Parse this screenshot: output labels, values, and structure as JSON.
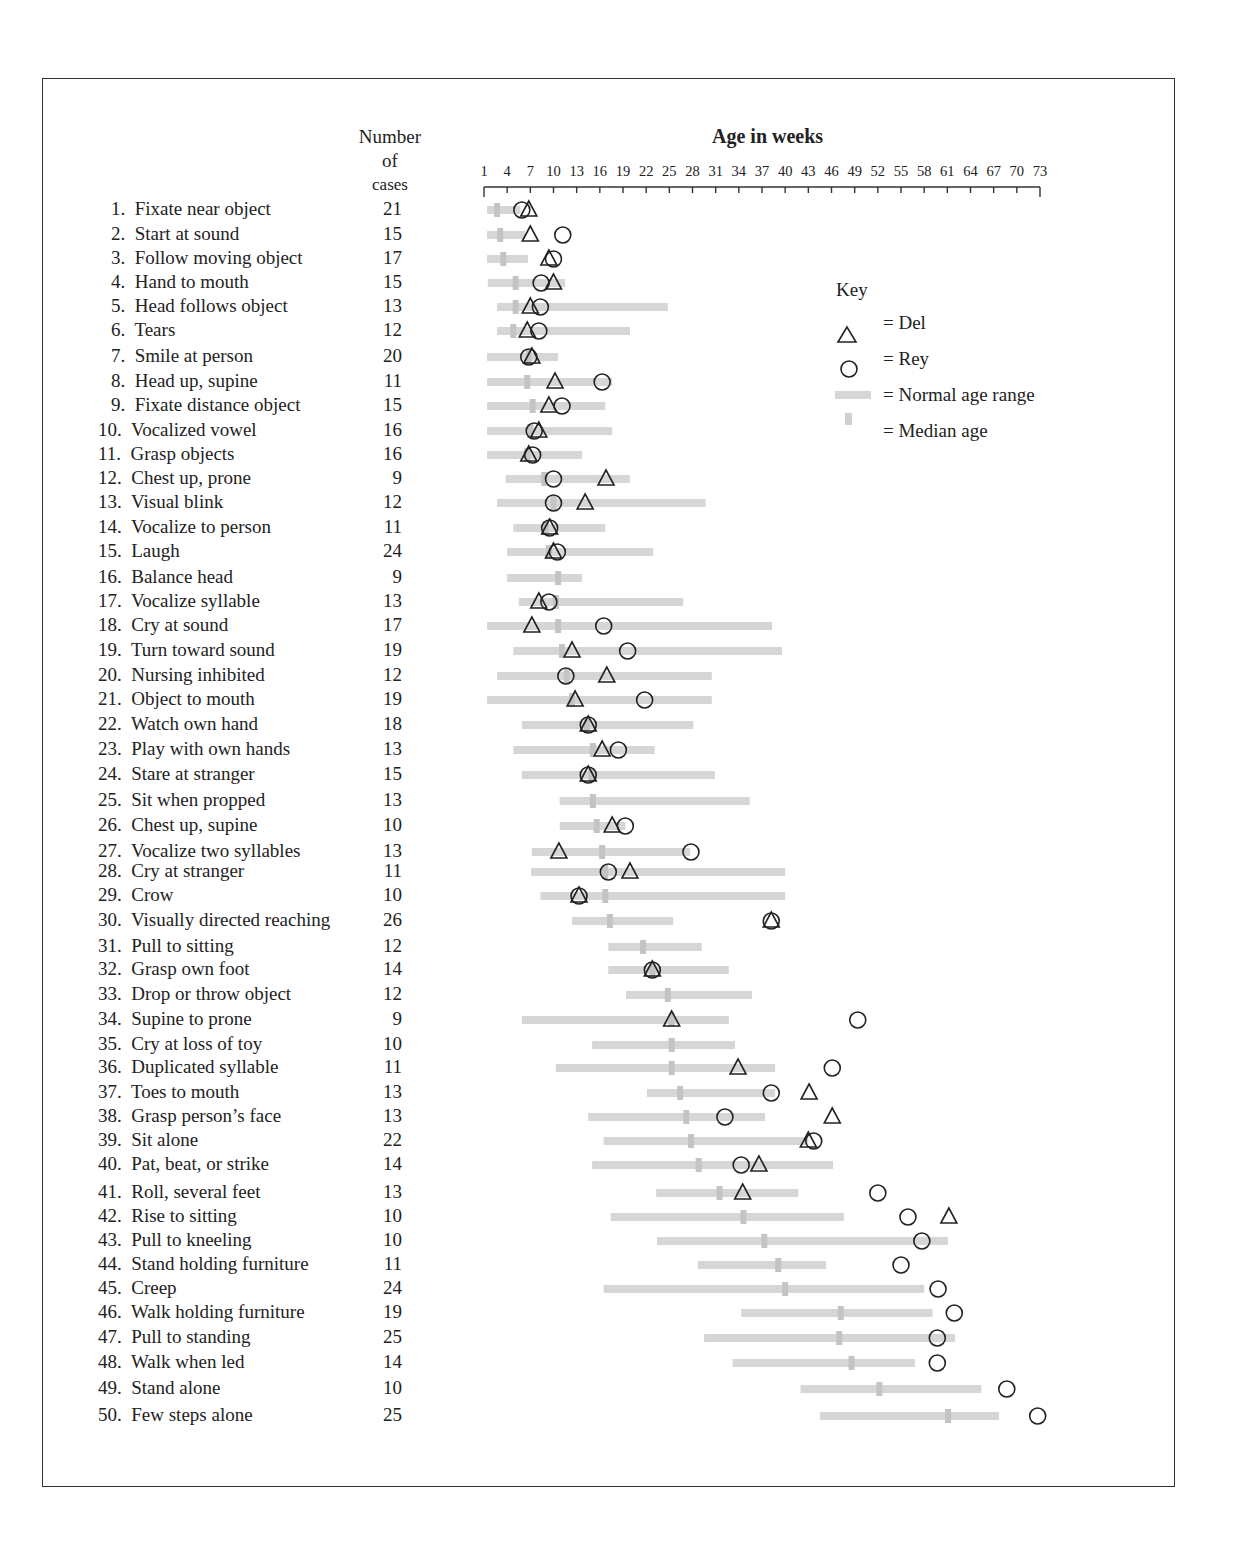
{
  "header": {
    "cases_line1": "Number",
    "cases_line2": "of",
    "cases_line3": "cases",
    "axis_title": "Age in weeks"
  },
  "key": {
    "title": "Key",
    "del": "= Del",
    "rey": "= Rey",
    "range": "= Normal age range",
    "median": "= Median age"
  },
  "colors": {
    "range_bar": "#d6d6d6",
    "median": "#c4c4c4",
    "marker": "#222222"
  },
  "chart_data": {
    "type": "range-dot",
    "title": "Age in weeks",
    "xlabel": "Age in weeks",
    "xlim": [
      1,
      73
    ],
    "xticks": [
      1,
      4,
      7,
      10,
      13,
      16,
      19,
      22,
      25,
      28,
      31,
      34,
      37,
      40,
      43,
      46,
      49,
      52,
      55,
      58,
      61,
      64,
      67,
      70,
      73
    ],
    "legend": [
      "Del (triangle)",
      "Rey (circle)",
      "Normal age range (gray bar)",
      "Median age (gray tick)"
    ],
    "items": [
      {
        "n": 1,
        "label": "Fixate near object",
        "cases": 21,
        "range": [
          1.4,
          5.7
        ],
        "median": 2.7,
        "del": 6.8,
        "rey": 5.9
      },
      {
        "n": 2,
        "label": "Start at sound",
        "cases": 15,
        "range": [
          1.4,
          6.3
        ],
        "median": 3.1,
        "del": 7.0,
        "rey": 11.2
      },
      {
        "n": 3,
        "label": "Follow moving object",
        "cases": 17,
        "range": [
          1.4,
          6.7
        ],
        "median": 3.5,
        "del": 9.4,
        "rey": 10.0
      },
      {
        "n": 4,
        "label": "Hand to mouth",
        "cases": 15,
        "range": [
          1.5,
          11.5
        ],
        "median": 5.1,
        "del": 10.0,
        "rey": 8.4
      },
      {
        "n": 5,
        "label": "Head follows object",
        "cases": 13,
        "range": [
          2.7,
          24.8
        ],
        "median": 5.1,
        "del": 7.0,
        "rey": 8.3
      },
      {
        "n": 6,
        "label": "Tears",
        "cases": 12,
        "range": [
          2.7,
          19.9
        ],
        "median": 4.8,
        "del": 6.6,
        "rey": 8.1
      },
      {
        "n": 7,
        "label": "Smile at person",
        "cases": 20,
        "range": [
          1.4,
          10.6
        ],
        "median": 6.8,
        "del": 7.2,
        "rey": 6.8
      },
      {
        "n": 8,
        "label": "Head up, supine",
        "cases": 11,
        "range": [
          1.4,
          17.6
        ],
        "median": 6.6,
        "del": 10.2,
        "rey": 16.3
      },
      {
        "n": 9,
        "label": "Fixate distance object",
        "cases": 15,
        "range": [
          1.4,
          16.7
        ],
        "median": 7.3,
        "del": 9.4,
        "rey": 11.1
      },
      {
        "n": 10,
        "label": "Vocalized vowel",
        "cases": 16,
        "range": [
          1.4,
          17.6
        ],
        "median": 7.0,
        "del": 8.1,
        "rey": 7.5
      },
      {
        "n": 11,
        "label": "Grasp objects",
        "cases": 16,
        "range": [
          1.4,
          13.7
        ],
        "median": 6.6,
        "del": 6.8,
        "rey": 7.3
      },
      {
        "n": 12,
        "label": "Chest up, prone",
        "cases": 9,
        "range": [
          3.8,
          19.9
        ],
        "median": 8.8,
        "del": 16.8,
        "rey": 10.0
      },
      {
        "n": 13,
        "label": "Visual blink",
        "cases": 12,
        "range": [
          2.7,
          29.7
        ],
        "median": 10.0,
        "del": 14.1,
        "rey": 10.0
      },
      {
        "n": 14,
        "label": "Vocalize to person",
        "cases": 11,
        "range": [
          4.8,
          16.7
        ],
        "median": 9.0,
        "del": 9.5,
        "rey": 9.5
      },
      {
        "n": 15,
        "label": "Laugh",
        "cases": 24,
        "range": [
          4.0,
          22.9
        ],
        "median": 9.4,
        "del": 10.0,
        "rey": 10.5
      },
      {
        "n": 16,
        "label": "Balance head",
        "cases": 9,
        "range": [
          4.0,
          13.7
        ],
        "median": 10.6,
        "del": null,
        "rey": null
      },
      {
        "n": 17,
        "label": "Vocalize syllable",
        "cases": 13,
        "range": [
          5.5,
          26.8
        ],
        "median": 10.3,
        "del": 8.1,
        "rey": 9.4
      },
      {
        "n": 18,
        "label": "Cry at sound",
        "cases": 17,
        "range": [
          1.4,
          38.3
        ],
        "median": 10.6,
        "del": 7.2,
        "rey": 16.5
      },
      {
        "n": 19,
        "label": "Turn toward sound",
        "cases": 19,
        "range": [
          4.8,
          39.6
        ],
        "median": 11.1,
        "del": 12.4,
        "rey": 19.6
      },
      {
        "n": 20,
        "label": "Nursing inhibited",
        "cases": 12,
        "range": [
          2.7,
          30.5
        ],
        "median": 11.7,
        "del": 16.9,
        "rey": 11.6
      },
      {
        "n": 21,
        "label": "Object to mouth",
        "cases": 19,
        "range": [
          1.4,
          30.5
        ],
        "median": 12.4,
        "del": 12.8,
        "rey": 21.8
      },
      {
        "n": 22,
        "label": "Watch own hand",
        "cases": 18,
        "range": [
          5.9,
          28.1
        ],
        "median": 14.3,
        "del": 14.5,
        "rey": 14.5
      },
      {
        "n": 23,
        "label": "Play with own hands",
        "cases": 13,
        "range": [
          4.8,
          23.1
        ],
        "median": 15.1,
        "del": 16.3,
        "rey": 18.4
      },
      {
        "n": 24,
        "label": "Stare at stranger",
        "cases": 15,
        "range": [
          5.9,
          30.9
        ],
        "median": 14.9,
        "del": 14.5,
        "rey": 14.5
      },
      {
        "n": 25,
        "label": "Sit when propped",
        "cases": 13,
        "range": [
          10.8,
          35.4
        ],
        "median": 15.1,
        "del": null,
        "rey": null
      },
      {
        "n": 26,
        "label": "Chest up, supine",
        "cases": 10,
        "range": [
          10.8,
          19.3
        ],
        "median": 15.6,
        "del": 17.6,
        "rey": 19.3
      },
      {
        "n": 27,
        "label": "Vocalize two syllables",
        "cases": 13,
        "range": [
          7.2,
          27.7
        ],
        "median": 16.3,
        "del": 10.7,
        "rey": 27.8
      },
      {
        "n": 28,
        "label": "Cry at stranger",
        "cases": 11,
        "range": [
          7.1,
          40.0
        ],
        "median": 16.7,
        "del": 19.9,
        "rey": 17.1
      },
      {
        "n": 29,
        "label": "Crow",
        "cases": 10,
        "range": [
          8.3,
          40.0
        ],
        "median": 16.7,
        "del": 13.3,
        "rey": 13.3
      },
      {
        "n": 30,
        "label": "Visually directed reaching",
        "cases": 26,
        "range": [
          12.4,
          25.5
        ],
        "median": 17.3,
        "del": 38.2,
        "rey": 38.2
      },
      {
        "n": 31,
        "label": "Pull to sitting",
        "cases": 12,
        "range": [
          17.1,
          29.2
        ],
        "median": 21.6,
        "del": null,
        "rey": null
      },
      {
        "n": 32,
        "label": "Grasp own foot",
        "cases": 14,
        "range": [
          17.1,
          32.7
        ],
        "median": 22.8,
        "del": 22.8,
        "rey": 22.8
      },
      {
        "n": 33,
        "label": "Drop or throw object",
        "cases": 12,
        "range": [
          19.4,
          35.7
        ],
        "median": 24.8,
        "del": null,
        "rey": null
      },
      {
        "n": 34,
        "label": "Supine to prone",
        "cases": 9,
        "range": [
          5.9,
          32.7
        ],
        "median": 25.3,
        "del": 25.3,
        "rey": 49.4
      },
      {
        "n": 35,
        "label": "Cry at loss of toy",
        "cases": 10,
        "range": [
          15.0,
          33.5
        ],
        "median": 25.3,
        "del": null,
        "rey": null
      },
      {
        "n": 36,
        "label": "Duplicated syllable",
        "cases": 11,
        "range": [
          10.3,
          38.7
        ],
        "median": 25.3,
        "del": 33.9,
        "rey": 46.1
      },
      {
        "n": 37,
        "label": "Toes to mouth",
        "cases": 13,
        "range": [
          22.1,
          38.7
        ],
        "median": 26.4,
        "del": 43.1,
        "rey": 38.2
      },
      {
        "n": 38,
        "label": "Grasp person’s face",
        "cases": 13,
        "range": [
          14.5,
          37.4
        ],
        "median": 27.2,
        "del": 46.1,
        "rey": 32.2
      },
      {
        "n": 39,
        "label": "Sit alone",
        "cases": 22,
        "range": [
          16.5,
          43.0
        ],
        "median": 27.8,
        "del": 43.0,
        "rey": 43.7
      },
      {
        "n": 40,
        "label": "Pat, beat, or strike",
        "cases": 14,
        "range": [
          15.0,
          46.2
        ],
        "median": 28.8,
        "del": 36.6,
        "rey": 34.3
      },
      {
        "n": 41,
        "label": "Roll, several feet",
        "cases": 13,
        "range": [
          23.3,
          41.7
        ],
        "median": 31.5,
        "del": 34.5,
        "rey": 52.0
      },
      {
        "n": 42,
        "label": "Rise to sitting",
        "cases": 10,
        "range": [
          17.4,
          47.6
        ],
        "median": 34.6,
        "del": 61.2,
        "rey": 55.9
      },
      {
        "n": 43,
        "label": "Pull to kneeling",
        "cases": 10,
        "range": [
          23.4,
          61.1
        ],
        "median": 37.3,
        "del": null,
        "rey": 57.7
      },
      {
        "n": 44,
        "label": "Stand holding furniture",
        "cases": 11,
        "range": [
          28.7,
          45.3
        ],
        "median": 39.1,
        "del": null,
        "rey": 55.0
      },
      {
        "n": 45,
        "label": "Creep",
        "cases": 24,
        "range": [
          16.5,
          58.0
        ],
        "median": 40.0,
        "del": null,
        "rey": 59.8
      },
      {
        "n": 46,
        "label": "Walk holding furniture",
        "cases": 19,
        "range": [
          34.3,
          59.1
        ],
        "median": 47.2,
        "del": null,
        "rey": 61.9
      },
      {
        "n": 47,
        "label": "Pull to standing",
        "cases": 25,
        "range": [
          29.5,
          62.0
        ],
        "median": 47.0,
        "del": null,
        "rey": 59.7
      },
      {
        "n": 48,
        "label": "Walk when led",
        "cases": 14,
        "range": [
          33.2,
          56.8
        ],
        "median": 48.6,
        "del": null,
        "rey": 59.7
      },
      {
        "n": 49,
        "label": "Stand alone",
        "cases": 10,
        "range": [
          42.0,
          65.4
        ],
        "median": 52.2,
        "del": null,
        "rey": 68.7
      },
      {
        "n": 50,
        "label": "Few steps alone",
        "cases": 25,
        "range": [
          44.5,
          67.7
        ],
        "median": 61.1,
        "del": null,
        "rey": 72.7
      }
    ]
  },
  "row_y": [
    210,
    235,
    259,
    283,
    307,
    331,
    357,
    382,
    406,
    431,
    455,
    479,
    503,
    528,
    552,
    578,
    602,
    626,
    651,
    676,
    700,
    725,
    750,
    775,
    801,
    826,
    852,
    872,
    896,
    921,
    947,
    970,
    995,
    1020,
    1045,
    1068,
    1093,
    1117,
    1141,
    1165,
    1193,
    1217,
    1241,
    1265,
    1289,
    1313,
    1338,
    1363,
    1389,
    1416
  ]
}
